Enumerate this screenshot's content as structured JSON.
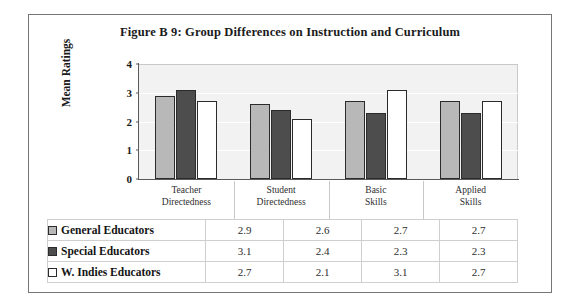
{
  "figure": {
    "title": "Figure B 9: Group Differences on Instruction and Curriculum"
  },
  "chart_data": {
    "type": "bar",
    "title": "Figure B 9: Group Differences on Instruction and Curriculum",
    "xlabel": "",
    "ylabel": "Mean Ratings",
    "ylim": [
      0,
      4
    ],
    "yticks": [
      "0",
      "1",
      "2",
      "3",
      "4"
    ],
    "grid": true,
    "legend_position": "bottom-table",
    "categories": [
      "Teacher Directedness",
      "Student Directedness",
      "Basic Skills",
      "Applied Skills"
    ],
    "category_lines": [
      [
        "Teacher",
        "Directedness"
      ],
      [
        "Student",
        "Directedness"
      ],
      [
        "Basic",
        "Skills"
      ],
      [
        "Applied",
        "Skills"
      ]
    ],
    "series": [
      {
        "name": "General Educators",
        "color": "#b8b8b8",
        "values": [
          2.9,
          2.6,
          2.7,
          2.7
        ],
        "labels": [
          "2.9",
          "2.6",
          "2.7",
          "2.7"
        ]
      },
      {
        "name": "Special Educators",
        "color": "#4d4d4d",
        "values": [
          3.1,
          2.4,
          2.3,
          2.3
        ],
        "labels": [
          "3.1",
          "2.4",
          "2.3",
          "2.3"
        ]
      },
      {
        "name": "W. Indies Educators",
        "color": "#ffffff",
        "values": [
          2.7,
          2.1,
          3.1,
          2.7
        ],
        "labels": [
          "2.7",
          "2.1",
          "3.1",
          "2.7"
        ]
      }
    ]
  },
  "colors": {
    "frame_border": "#767676",
    "plot_background": "#f2f2f2",
    "gridline": "#ffffff",
    "axis_line": "#5a5a5a",
    "table_border": "#cfcfcf",
    "bar_outline": "#2b2b2b"
  }
}
